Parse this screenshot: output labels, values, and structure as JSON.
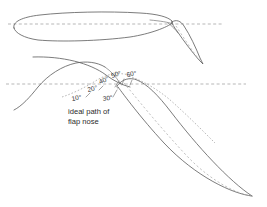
{
  "figure": {
    "name": "flap-deflection-diagram",
    "title": "Ideal path of flap nose",
    "background_color": "#ffffff",
    "outline_color": "#5a5a5a",
    "dashed_color": "#9a9a9a",
    "text_color": "#2b2b2b",
    "width": 267,
    "height": 207
  },
  "caption": {
    "line1": "ideal path of",
    "line2": "flap nose"
  },
  "angle_labels": [
    {
      "id": "angle-10",
      "text": "10°",
      "x": 75,
      "y": 100
    },
    {
      "id": "angle-20",
      "text": "20°",
      "x": 93,
      "y": 90
    },
    {
      "id": "angle-30",
      "text": "30°",
      "x": 106,
      "y": 100
    },
    {
      "id": "angle-40",
      "text": "40°",
      "x": 104,
      "y": 82
    },
    {
      "id": "angle-50",
      "text": "50°",
      "x": 114,
      "y": 77
    },
    {
      "id": "angle-60",
      "text": "60°",
      "x": 128,
      "y": 77
    }
  ],
  "angles_deg": [
    10,
    20,
    30,
    40,
    50,
    60
  ],
  "views": {
    "upper": {
      "name": "undeflected-configuration",
      "description": "Main airfoil with flap retracted near chord line",
      "chord_line": {
        "y": 24,
        "x1": 8,
        "x2": 222
      }
    },
    "lower": {
      "name": "deflected-configuration",
      "description": "Main airfoil cove with flap deflected 60 degrees",
      "chord_line": {
        "y": 84,
        "x1": 6,
        "x2": 246
      }
    }
  },
  "geometry": {
    "upper_main_outline": "M 14 28 C 12 22 22 17 40 15 C 66 12 108 11 140 13 C 158 14 168 17 172 21 L 172 23 C 168 27 150 34 130 37 C 100 41 60 42 38 40 C 24 38 15 33 14 28 Z",
    "upper_main_te": "M 152 21 C 160 21 168 22 173 24 L 176 27",
    "upper_flap_outline": "M 172 22 C 176 20 181 21 184 25 C 190 34 196 48 200 58 L 202 62 L 199 60 C 192 52 183 40 177 31 C 174 27 172 24 172 22 Z",
    "upper_flap_camber": "M 176 25 C 182 34 192 50 200 61",
    "lower_main_upper": "M 33 57 C 60 56 88 62 104 74 C 112 80 120 84 128 86",
    "lower_main_lower": "M 14 110 C 22 106 30 96 38 86 C 48 74 62 66 76 63 C 86 61 96 62 104 66",
    "lower_main_cove": "M 104 66 C 110 70 116 76 120 82 C 122 85 124 87 126 88",
    "lower_flap_outline": "M 117 85 C 122 79 129 77 136 79 C 146 82 157 93 170 110 C 196 144 228 180 252 196 L 248 195 C 220 176 188 146 164 120 C 144 98 128 87 119 86 Z",
    "lower_flap_lower": "M 118 86 C 124 94 140 116 164 142 C 196 176 232 194 252 196",
    "lower_flap_camber": "M 124 82 C 134 94 158 124 186 154 C 214 184 240 194 252 196",
    "nose_path_arc": "M 64 96 C 74 92 86 86 96 80 C 106 74 118 72 128 74",
    "nose_path_tail": "M 128 76 C 142 80 156 88 168 98 C 184 112 200 128 214 142"
  },
  "tick_marks": [
    {
      "id": "tick-10",
      "x1": 86,
      "y1": 96,
      "x2": 90,
      "y2": 93
    },
    {
      "id": "tick-20",
      "x1": 98,
      "y1": 90,
      "x2": 102,
      "y2": 86
    },
    {
      "id": "tick-30",
      "x1": 112,
      "y1": 96,
      "x2": 116,
      "y2": 90
    },
    {
      "id": "tick-40",
      "x1": 114,
      "y1": 86,
      "x2": 118,
      "y2": 80
    },
    {
      "id": "tick-50",
      "x1": 122,
      "y1": 84,
      "x2": 124,
      "y2": 78
    },
    {
      "id": "tick-60",
      "x1": 130,
      "y1": 84,
      "x2": 132,
      "y2": 79
    }
  ],
  "hinge": {
    "x": 120,
    "y": 84
  }
}
